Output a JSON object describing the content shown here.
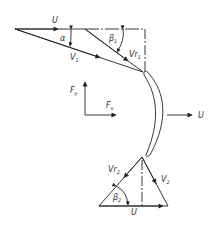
{
  "diagram": {
    "inlet_triangle": {
      "labels": {
        "U": "U",
        "alpha": "α",
        "beta1": "β",
        "beta1_sub": "1",
        "V1": "V",
        "V1_sub": "1",
        "Vr1": "Vr",
        "Vr1_sub": "1"
      }
    },
    "forces": {
      "Fy": "F",
      "Fy_sub": "y",
      "Fx": "F",
      "Fx_sub": "x"
    },
    "blade": {
      "velocity_label": "U"
    },
    "outlet_triangle": {
      "labels": {
        "Vr2": "Vr",
        "Vr2_sub": "2",
        "V2": "V",
        "V2_sub": "2",
        "beta2": "β",
        "beta2_sub": "2",
        "U": "U"
      }
    },
    "colors": {
      "line": "#222222",
      "text": "#333333",
      "background": "#ffffff"
    }
  }
}
